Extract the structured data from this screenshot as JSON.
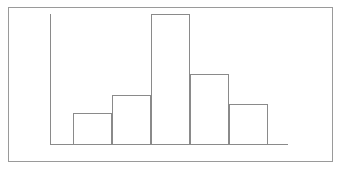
{
  "figure": {
    "border_color": "#9a9a9a",
    "background_color": "#ffffff",
    "frame": {
      "left": 8,
      "top": 7,
      "width": 325,
      "height": 155
    }
  },
  "artifacts": {
    "scan_speckle_label": "scan-speckle"
  },
  "chart_data": {
    "type": "bar",
    "title": "",
    "subtitle": "",
    "xlabel": "",
    "ylabel": "",
    "categories": [
      "1",
      "2",
      "3",
      "4",
      "5",
      "6"
    ],
    "values": [
      0,
      31,
      49,
      130,
      70,
      40
    ],
    "tick_labels": [],
    "legend": [],
    "legend_position": "none",
    "annotations": [],
    "grid": false,
    "xlim": [
      0,
      6
    ],
    "ylim": [
      0,
      130
    ],
    "bar_style": "outlined",
    "bar_fill_color": "none",
    "bar_edge_color": "#8a8a8a",
    "axis_color": "#8a8a8a",
    "axis_line_width": 1,
    "bar_width_px": 39,
    "baseline_y_px": 144,
    "y_axis_x_px": 50,
    "y_axis_top_px": 14,
    "x_axis_left_px": 50,
    "x_axis_right_px": 288,
    "plot_left_px": 50,
    "plot_top_px": 14,
    "bars_px": [
      {
        "index": 0,
        "left": 50,
        "top": 144,
        "width": 39,
        "height": 0
      },
      {
        "index": 1,
        "left": 73,
        "top": 113,
        "width": 39,
        "height": 31
      },
      {
        "index": 2,
        "left": 112,
        "top": 95,
        "width": 39,
        "height": 49
      },
      {
        "index": 3,
        "left": 151,
        "top": 14,
        "width": 39,
        "height": 130
      },
      {
        "index": 4,
        "left": 190,
        "top": 74,
        "width": 39,
        "height": 70
      },
      {
        "index": 5,
        "left": 229,
        "top": 104,
        "width": 39,
        "height": 40
      }
    ]
  }
}
